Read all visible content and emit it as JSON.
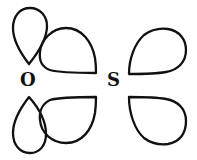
{
  "diagram": {
    "atoms": [
      {
        "id": "oxygen",
        "label": "O"
      },
      {
        "id": "sulfur",
        "label": "S"
      }
    ],
    "orbitals": [
      {
        "atom": "O",
        "name": "vertical-lobe-upper"
      },
      {
        "atom": "O",
        "name": "vertical-lobe-lower"
      },
      {
        "atom": "O",
        "name": "hybrid-lobe-upper-right"
      },
      {
        "atom": "O",
        "name": "hybrid-lobe-lower-right"
      },
      {
        "atom": "S",
        "name": "hybrid-lobe-upper-right"
      },
      {
        "atom": "S",
        "name": "hybrid-lobe-lower-right"
      }
    ],
    "colors": {
      "stroke": "#111111",
      "background": "#ffffff"
    }
  }
}
